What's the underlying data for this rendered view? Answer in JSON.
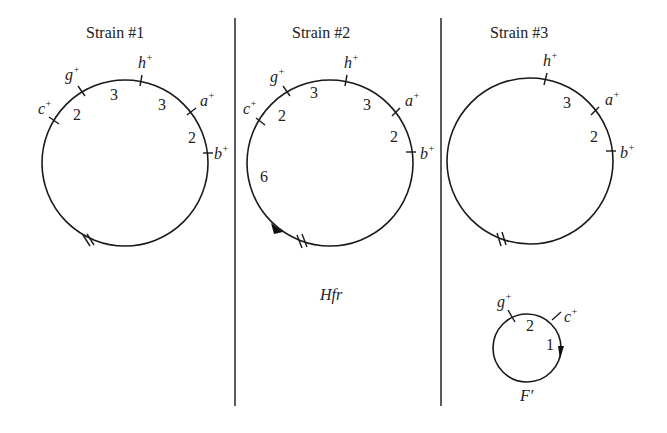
{
  "panels": [
    {
      "title": "Strain #1",
      "genes": [
        "c+",
        "g+",
        "h+",
        "a+",
        "b+"
      ],
      "distances": [
        "2",
        "3",
        "3",
        "2"
      ],
      "origin_marker": "//",
      "label": ""
    },
    {
      "title": "Strain #2",
      "genes": [
        "c+",
        "g+",
        "h+",
        "a+",
        "b+"
      ],
      "distances": [
        "2",
        "3",
        "3",
        "2",
        "6"
      ],
      "origin_marker": "//",
      "transfer_arrow": "arrow toward //",
      "label": "Hfr"
    },
    {
      "title": "Strain #3",
      "genes": [
        "h+",
        "a+",
        "b+"
      ],
      "distances": [
        "3",
        "2"
      ],
      "origin_marker": "//",
      "label": ""
    }
  ],
  "plasmid": {
    "genes": [
      "g+",
      "c+"
    ],
    "distances": [
      "2",
      "1"
    ],
    "label": "F′"
  },
  "text": {
    "t1": "Strain #1",
    "t2": "Strain #2",
    "t3": "Strain #3",
    "hfr": "Hfr",
    "fprime": "F′",
    "c": "c",
    "g": "g",
    "h": "h",
    "a": "a",
    "b": "b",
    "plus": "+",
    "d2": "2",
    "d3": "3",
    "d6": "6",
    "d1": "1"
  }
}
